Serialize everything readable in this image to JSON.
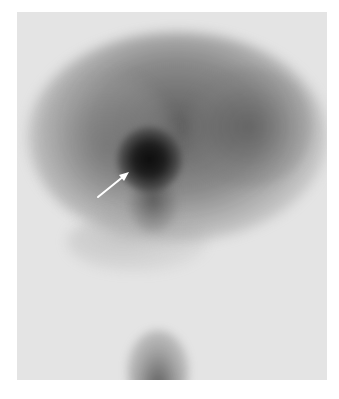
{
  "image": {
    "type": "grayscale scintigraphy scan",
    "background_color": "#ffffff",
    "scan_background_color": "#e4e4e4",
    "bounds": {
      "x": 17,
      "y": 12,
      "width": 310,
      "height": 368
    },
    "regions": [
      {
        "name": "diffuse-organ-uptake",
        "description": "broad gray uptake across upper half"
      },
      {
        "name": "focal-hot-spot",
        "description": "intense dark focal uptake",
        "center": [
          143,
          155
        ]
      },
      {
        "name": "focal-tail",
        "description": "fainter uptake extending below hot spot"
      },
      {
        "name": "bottom-uptake",
        "description": "dark area at bottom center",
        "center": [
          150,
          360
        ]
      }
    ],
    "annotation": {
      "type": "arrow",
      "color": "#ffffff",
      "from": [
        98,
        197
      ],
      "to": [
        128,
        173
      ],
      "points_to": "focal-hot-spot"
    }
  }
}
